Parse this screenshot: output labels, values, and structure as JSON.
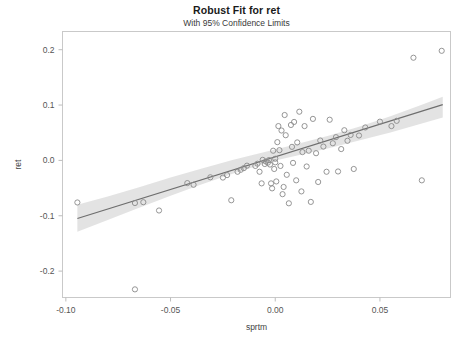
{
  "chart_data": {
    "type": "scatter",
    "title": "Robust Fit for ret",
    "subtitle": "With 95% Confidence Limits",
    "xlabel": "sprtm",
    "ylabel": "ret",
    "xlim": [
      -0.1016,
      0.0837
    ],
    "ylim": [
      -0.2477,
      0.2329
    ],
    "grid": false,
    "legend": null,
    "xticks": [
      -0.1,
      -0.05,
      0.0,
      0.05
    ],
    "xticklabels": [
      "-0.10",
      "-0.05",
      "0.00",
      "0.05"
    ],
    "yticks": [
      0.2,
      0.1,
      0.0,
      -0.1,
      -0.2
    ],
    "yticklabels": [
      "0.2",
      "0.1",
      "0.0",
      "-0.1",
      "-0.2"
    ],
    "colors": {
      "marker_stroke": "#8a8a8a",
      "fit_line": "#6e6e6e",
      "confidence_band": "#d2d2d2",
      "frame": "#c9c9c9",
      "text": "#222222"
    },
    "fit": {
      "label": "robust fit line",
      "intercept": 0.0065,
      "slope": 1.18,
      "x_start": -0.0945,
      "x_end": 0.08
    },
    "confidence": {
      "label": "95% confidence limits",
      "level": 0.95,
      "x": [
        -0.0945,
        -0.08,
        -0.065,
        -0.05,
        -0.035,
        -0.02,
        -0.005,
        0.0,
        0.01,
        0.025,
        0.04,
        0.055,
        0.07,
        0.08
      ],
      "upper": [
        -0.08,
        -0.065,
        -0.0485,
        -0.031,
        -0.0145,
        0.001,
        0.015,
        0.0195,
        0.029,
        0.044,
        0.061,
        0.08,
        0.1005,
        0.115
      ],
      "lower": [
        -0.129,
        -0.1075,
        -0.0855,
        -0.064,
        -0.043,
        -0.0235,
        -0.0055,
        0.0,
        0.0085,
        0.0215,
        0.036,
        0.0505,
        0.0665,
        0.0775
      ]
    },
    "points": [
      {
        "x": -0.0945,
        "y": -0.076
      },
      {
        "x": -0.067,
        "y": -0.233
      },
      {
        "x": -0.067,
        "y": -0.077
      },
      {
        "x": -0.063,
        "y": -0.0755
      },
      {
        "x": -0.0555,
        "y": -0.0905
      },
      {
        "x": -0.042,
        "y": -0.041
      },
      {
        "x": -0.039,
        "y": -0.044
      },
      {
        "x": -0.031,
        "y": -0.0305
      },
      {
        "x": -0.025,
        "y": -0.031
      },
      {
        "x": -0.023,
        "y": -0.0265
      },
      {
        "x": -0.021,
        "y": -0.072
      },
      {
        "x": -0.018,
        "y": -0.0205
      },
      {
        "x": -0.0165,
        "y": -0.017
      },
      {
        "x": -0.015,
        "y": -0.014
      },
      {
        "x": -0.0135,
        "y": -0.0095
      },
      {
        "x": -0.0095,
        "y": -0.01
      },
      {
        "x": -0.0085,
        "y": -0.006
      },
      {
        "x": -0.0075,
        "y": -0.0205
      },
      {
        "x": -0.0065,
        "y": -0.0415
      },
      {
        "x": -0.006,
        "y": 0.001
      },
      {
        "x": -0.005,
        "y": -0.0065
      },
      {
        "x": -0.0045,
        "y": -0.002
      },
      {
        "x": -0.0035,
        "y": -0.004
      },
      {
        "x": -0.003,
        "y": 0.0005
      },
      {
        "x": -0.0025,
        "y": -0.0075
      },
      {
        "x": -0.002,
        "y": -0.0415
      },
      {
        "x": -0.0015,
        "y": -0.0505
      },
      {
        "x": -0.001,
        "y": 0.0175
      },
      {
        "x": -0.0005,
        "y": -0.0155
      },
      {
        "x": 0.0,
        "y": -0.0035
      },
      {
        "x": 0.0,
        "y": 0.003
      },
      {
        "x": 0.0005,
        "y": -0.038
      },
      {
        "x": 0.001,
        "y": 0.033
      },
      {
        "x": 0.0015,
        "y": 0.062
      },
      {
        "x": 0.002,
        "y": 0.0185
      },
      {
        "x": 0.0025,
        "y": -0.01
      },
      {
        "x": 0.003,
        "y": 0.054
      },
      {
        "x": 0.0035,
        "y": -0.061
      },
      {
        "x": 0.004,
        "y": -0.048
      },
      {
        "x": 0.0045,
        "y": 0.082
      },
      {
        "x": 0.005,
        "y": 0.0455
      },
      {
        "x": 0.0055,
        "y": -0.026
      },
      {
        "x": 0.0065,
        "y": -0.0775
      },
      {
        "x": 0.0075,
        "y": 0.064
      },
      {
        "x": 0.008,
        "y": 0.0245
      },
      {
        "x": 0.0085,
        "y": -0.0045
      },
      {
        "x": 0.009,
        "y": 0.0695
      },
      {
        "x": 0.01,
        "y": -0.036
      },
      {
        "x": 0.0105,
        "y": 0.0325
      },
      {
        "x": 0.0115,
        "y": 0.088
      },
      {
        "x": 0.0125,
        "y": -0.056
      },
      {
        "x": 0.013,
        "y": 0.015
      },
      {
        "x": 0.014,
        "y": 0.062
      },
      {
        "x": 0.015,
        "y": -0.011
      },
      {
        "x": 0.016,
        "y": 0.0175
      },
      {
        "x": 0.017,
        "y": -0.075
      },
      {
        "x": 0.018,
        "y": 0.075
      },
      {
        "x": 0.0195,
        "y": 0.013
      },
      {
        "x": 0.0205,
        "y": -0.039
      },
      {
        "x": 0.0215,
        "y": 0.036
      },
      {
        "x": 0.023,
        "y": 0.025
      },
      {
        "x": 0.0245,
        "y": -0.0205
      },
      {
        "x": 0.026,
        "y": 0.0735
      },
      {
        "x": 0.0275,
        "y": 0.031
      },
      {
        "x": 0.029,
        "y": 0.042
      },
      {
        "x": 0.03,
        "y": -0.02
      },
      {
        "x": 0.0315,
        "y": 0.0205
      },
      {
        "x": 0.033,
        "y": 0.0545
      },
      {
        "x": 0.0345,
        "y": 0.0355
      },
      {
        "x": 0.036,
        "y": 0.046
      },
      {
        "x": 0.0375,
        "y": -0.0155
      },
      {
        "x": 0.04,
        "y": 0.045
      },
      {
        "x": 0.043,
        "y": 0.0595
      },
      {
        "x": 0.05,
        "y": 0.07
      },
      {
        "x": 0.0555,
        "y": 0.062
      },
      {
        "x": 0.058,
        "y": 0.0715
      },
      {
        "x": 0.066,
        "y": 0.1855
      },
      {
        "x": 0.07,
        "y": -0.036
      },
      {
        "x": 0.0795,
        "y": 0.198
      }
    ]
  }
}
